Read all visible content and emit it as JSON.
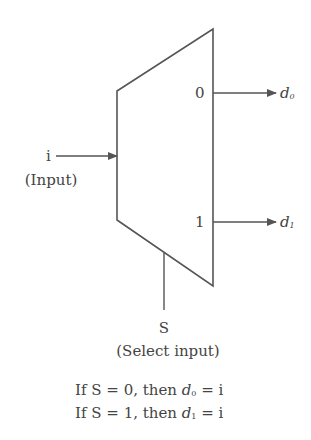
{
  "diagram": {
    "colors": {
      "stroke": "#555555",
      "text": "#444444",
      "background": "#ffffff"
    },
    "block": {
      "shape": "trapezoid",
      "vertices": [
        [
          117,
          91
        ],
        [
          213,
          29
        ],
        [
          213,
          286
        ],
        [
          117,
          220
        ]
      ],
      "output_port_labels": [
        "0",
        "1"
      ]
    },
    "input": {
      "symbol": "i",
      "label": "(Input)"
    },
    "outputs": [
      {
        "base": "d",
        "subscript": "0",
        "port": "0"
      },
      {
        "base": "d",
        "subscript": "1",
        "port": "1"
      }
    ],
    "select": {
      "symbol": "S",
      "label": "(Select input)"
    },
    "rules": [
      {
        "prefix": "If S = 0, then ",
        "var": "d",
        "sub": "0",
        "suffix": " = i"
      },
      {
        "prefix": "If S = 1, then ",
        "var": "d",
        "sub": "1",
        "suffix": " = i"
      }
    ]
  }
}
